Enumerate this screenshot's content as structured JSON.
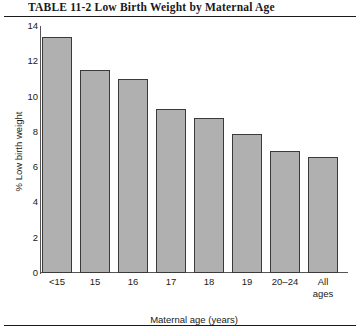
{
  "title": "TABLE  11-2    Low Birth Weight by Maternal Age",
  "chart_data": {
    "type": "bar",
    "title": "Low Birth Weight by Maternal Age",
    "xlabel": "Maternal age (years)",
    "ylabel": "% Low birth weight",
    "categories": [
      "<15",
      "15",
      "16",
      "17",
      "18",
      "19",
      "20–24",
      "All\nages"
    ],
    "values": [
      13.4,
      11.5,
      11.0,
      9.3,
      8.8,
      7.9,
      6.9,
      6.6
    ],
    "ylim": [
      0,
      14
    ],
    "yticks": [
      14,
      12,
      10,
      8,
      6,
      4,
      2,
      0
    ],
    "grid": false,
    "legend": false,
    "bar_color": "#b0b0b0",
    "bar_edge_color": "#3a3a3a",
    "axis_color": "#555555"
  }
}
